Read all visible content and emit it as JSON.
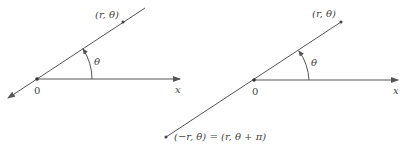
{
  "figure": {
    "left": {
      "point_label": "(r, θ)",
      "angle_label": "θ",
      "origin_label": "0",
      "axis_label": "x"
    },
    "right": {
      "point_label": "(r, θ)",
      "angle_label": "θ",
      "origin_label": "0",
      "axis_label": "x",
      "opposite_point_label": "(−r, θ) = (r, θ + π)"
    },
    "colors": {
      "ink": "#555555",
      "text": "#444444",
      "background": "#ffffff"
    }
  }
}
